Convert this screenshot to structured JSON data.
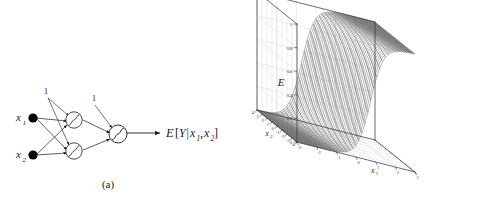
{
  "figure": {
    "panels": [
      {
        "id": "a",
        "caption": "(a)",
        "type": "neural-network-diagram",
        "inputs": [
          {
            "label": "x",
            "sub": "1"
          },
          {
            "label": "x",
            "sub": "2"
          }
        ],
        "bias_labels": [
          "1",
          "1"
        ],
        "hidden_units": 2,
        "output_units": 1,
        "unit_symbol": "sigmoid",
        "output_label": {
          "script": "E",
          "bracket_open": "[",
          "y": "Y",
          "bar": "|",
          "x1": "x",
          "x1sub": "1",
          "comma": ",",
          "x2": "x",
          "x2sub": "2",
          "bracket_close": "]"
        }
      },
      {
        "id": "b",
        "caption": "(b)",
        "type": "surface-plot"
      }
    ]
  },
  "chart_data": {
    "type": "surface",
    "title": "",
    "zlabel": "E",
    "xlabel": "x",
    "xlabel_sub": "1",
    "ylabel": "x",
    "ylabel_sub": "2",
    "xlim": [
      -3,
      3
    ],
    "ylim": [
      -4,
      4
    ],
    "zlim": [
      0,
      1
    ],
    "xticks": [
      -3,
      -2,
      -1,
      0,
      1,
      2,
      3
    ],
    "yticks": [
      -4,
      -3,
      -2,
      -1,
      0,
      1,
      2,
      3,
      4
    ],
    "zticks": [
      0,
      0.2,
      0.4,
      0.6,
      0.8,
      1
    ],
    "ztick_labels": [
      "0",
      "0.2",
      "0.4",
      "0.6",
      "0.8",
      "1"
    ],
    "xtick_labels": [
      "-3",
      "-2",
      "-1",
      "0",
      "1",
      "2",
      "3"
    ],
    "ytick_labels": [
      "-4",
      "-3",
      "-2",
      "-1",
      "0",
      "1",
      "2",
      "3",
      "4"
    ],
    "grid": true,
    "mesh": true,
    "mesh_color": "#1f1f1f",
    "surface": {
      "formula": "logistic-ridge",
      "nx": 41,
      "ny": 41,
      "w1": 3.0,
      "w2": 0.55,
      "bias": 0.0,
      "amplitude": 1.0
    },
    "view": {
      "azimuth": -37.5,
      "elevation": 30
    }
  }
}
